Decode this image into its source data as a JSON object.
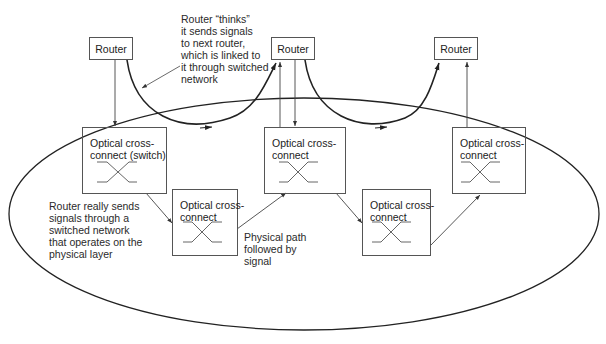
{
  "routers": [
    {
      "label": "Router"
    },
    {
      "label": "Router"
    },
    {
      "label": "Router"
    }
  ],
  "cross_connects": [
    {
      "label": "Optical cross-\nconnect (switch)"
    },
    {
      "label": "Optical cross-\nconnect"
    },
    {
      "label": "Optical cross-\nconnect"
    },
    {
      "label": "Optical cross-\nconnect"
    },
    {
      "label": "Optical cross-\nconnect"
    }
  ],
  "annotations": {
    "router_thinks": "Router “thinks”\nit sends signals\nto next router,\nwhich is linked to\nit through switched\nnetwork",
    "router_really": "Router really sends\nsignals through a\nswitched network\nthat operates on the\nphysical layer",
    "physical_path": "Physical path\nfollowed by\nsignal"
  },
  "colors": {
    "line": "#333333",
    "box_border": "#555555",
    "background": "#ffffff"
  }
}
